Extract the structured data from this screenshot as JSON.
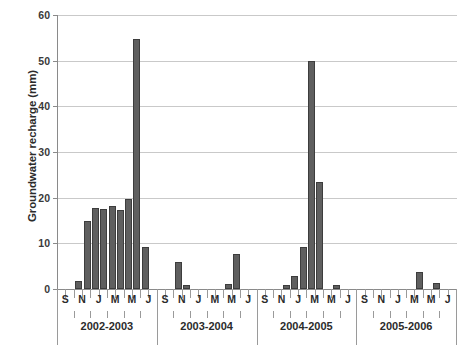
{
  "chart_data": {
    "type": "bar",
    "title": "",
    "xlabel": "",
    "ylabel": "Groundwater recharge (mm)",
    "ylim": [
      0,
      60
    ],
    "ytick_labels": [
      "0",
      "10",
      "20",
      "30",
      "40",
      "50",
      "60"
    ],
    "ytick_values": [
      0,
      10,
      20,
      30,
      40,
      50,
      60
    ],
    "grid": true,
    "legend": false,
    "xtick_labels": [
      "S",
      "N",
      "J",
      "M",
      "M",
      "J",
      "S",
      "N",
      "J",
      "M",
      "M",
      "J",
      "S",
      "N",
      "J",
      "M",
      "M",
      "J",
      "S",
      "N",
      "J",
      "M",
      "M",
      "J"
    ],
    "group_labels": [
      "2002-2003",
      "2003-2004",
      "2004-2005",
      "2005-2006"
    ],
    "months_per_group": 12,
    "categories": [
      "S",
      "O",
      "N",
      "D",
      "J",
      "F",
      "M",
      "A",
      "M",
      "J",
      "J",
      "A",
      "S",
      "O",
      "N",
      "D",
      "J",
      "F",
      "M",
      "A",
      "M",
      "J",
      "J",
      "A",
      "S",
      "O",
      "N",
      "D",
      "J",
      "F",
      "M",
      "A",
      "M",
      "J",
      "J",
      "A",
      "S",
      "O",
      "N",
      "D",
      "J",
      "F",
      "M",
      "A",
      "M",
      "J",
      "J",
      "A"
    ],
    "values": [
      0,
      0,
      1.7,
      15,
      17.8,
      17.5,
      18.2,
      17.3,
      19.7,
      54.8,
      9.2,
      0,
      0,
      0,
      5.9,
      0.8,
      0,
      0,
      0,
      0,
      1.2,
      7.7,
      0,
      0,
      0,
      0,
      0,
      0.9,
      2.9,
      9.3,
      50,
      23.5,
      0,
      0.9,
      0,
      0,
      0,
      0,
      0,
      0,
      0,
      0,
      0,
      3.8,
      0,
      1.3,
      0,
      0
    ],
    "bar_color": "#5f5f5f",
    "bar_edge_color": "#3d3d3d",
    "grid_color": "#c9c9c9",
    "axis_color": "#8a8a8a"
  }
}
